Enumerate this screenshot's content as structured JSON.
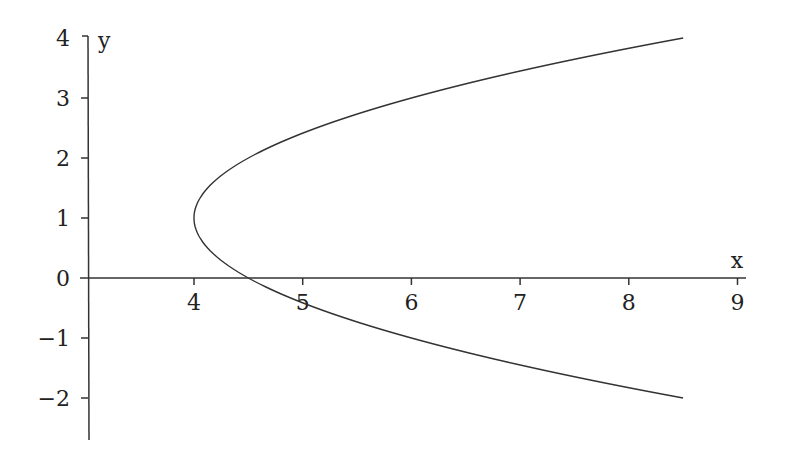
{
  "chart_data": {
    "type": "line",
    "title": "",
    "xlabel": "x",
    "ylabel": "y",
    "equation": "x = 4 + (y-1)^2/2",
    "x_ticks": [
      "4",
      "5",
      "6",
      "7",
      "8",
      "9"
    ],
    "y_ticks": [
      "4",
      "3",
      "2",
      "1",
      "0",
      "−1",
      "−2"
    ],
    "xlim": [
      3,
      9
    ],
    "ylim": [
      -2.7,
      4
    ],
    "grid": false,
    "series": [
      {
        "name": "parabola",
        "y_range": [
          -2,
          4
        ],
        "vertex": [
          4,
          1
        ],
        "x_intercept": 4.5
      }
    ]
  }
}
